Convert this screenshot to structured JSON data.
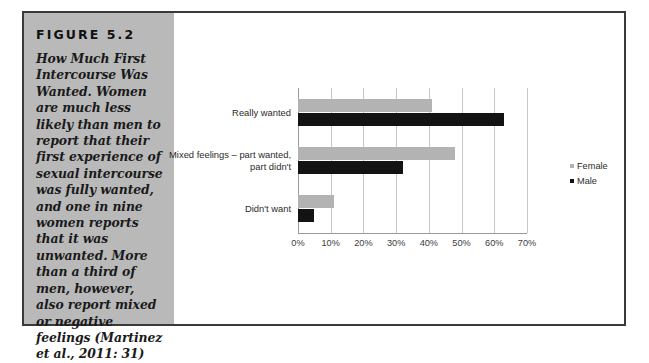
{
  "figure": {
    "label": "FIGURE 5.2",
    "caption": "How Much First Intercourse Was Wanted. Women are much less likely than men to report that their first experience of sexual intercourse was fully wanted, and one in nine women reports that it was unwanted. More than a third of men, however, also report mixed or negative feelings (Martinez et al., 2011: 31)"
  },
  "chart_data": {
    "type": "bar",
    "orientation": "horizontal",
    "title": "",
    "xlabel": "",
    "ylabel": "",
    "xlim": [
      0,
      70
    ],
    "xticks": [
      "0%",
      "10%",
      "20%",
      "30%",
      "40%",
      "50%",
      "60%",
      "70%"
    ],
    "xtick_values": [
      0,
      10,
      20,
      30,
      40,
      50,
      60,
      70
    ],
    "grid": true,
    "legend_position": "right",
    "categories": [
      "Really wanted",
      "Mixed feelings – part wanted,\npart didn't",
      "Didn't want"
    ],
    "series": [
      {
        "name": "Female",
        "color": "#b3b3b3",
        "values": [
          41,
          48,
          11
        ]
      },
      {
        "name": "Male",
        "color": "#131313",
        "values": [
          63,
          32,
          5
        ]
      }
    ]
  }
}
